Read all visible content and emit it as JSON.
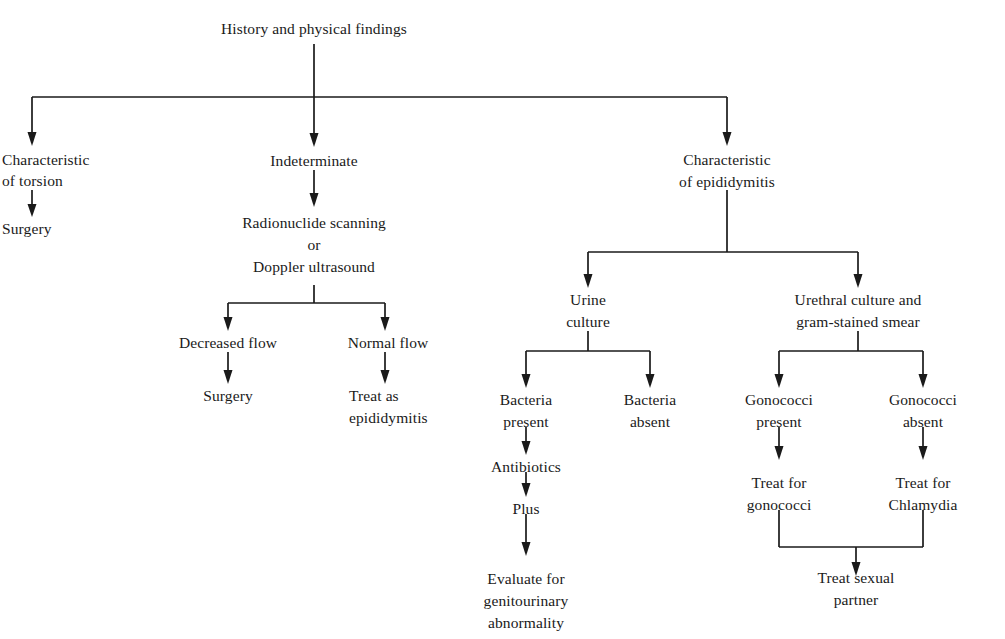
{
  "diagram": {
    "background_color": "#ffffff",
    "line_color": "#1a1a1a",
    "text_color": "#1a1a1a",
    "nodes": {
      "root": {
        "label": "History and physical findings",
        "x": 314,
        "y": 34
      },
      "torsion": {
        "line1": "Characteristic",
        "line2": "of torsion",
        "x": 22,
        "y": 159
      },
      "torsion_surgery": {
        "label": "Surgery",
        "x": 22,
        "y": 228
      },
      "indeterminate": {
        "label": "Indeterminate",
        "x": 314,
        "y": 160
      },
      "imaging": {
        "line1": "Radionuclide scanning",
        "line2": "or",
        "line3": "Doppler ultrasound",
        "x": 314,
        "y": 222
      },
      "decreased_flow": {
        "label": "Decreased flow",
        "x": 228,
        "y": 342
      },
      "normal_flow": {
        "label": "Normal flow",
        "x": 388,
        "y": 342
      },
      "flow_surgery": {
        "label": "Surgery",
        "x": 228,
        "y": 395
      },
      "treat_as_epi": {
        "line1": "Treat as",
        "line2": "epididymitis",
        "x": 349,
        "y": 395
      },
      "epididymitis": {
        "line1": "Characteristic",
        "line2": "of epididymitis",
        "x": 727,
        "y": 159
      },
      "urine_culture": {
        "line1": "Urine",
        "line2": "culture",
        "x": 588,
        "y": 299
      },
      "urethral_culture": {
        "line1": "Urethral culture and",
        "line2": "gram-stained smear",
        "x": 858,
        "y": 299
      },
      "bacteria_present": {
        "line1": "Bacteria",
        "line2": "present",
        "x": 526,
        "y": 399
      },
      "bacteria_absent": {
        "line1": "Bacteria",
        "line2": "absent",
        "x": 650,
        "y": 399
      },
      "antibiotics": {
        "label": "Antibiotics",
        "x": 526,
        "y": 466
      },
      "plus": {
        "label": "Plus",
        "x": 526,
        "y": 508
      },
      "evaluate_gu": {
        "line1": "Evaluate for",
        "line2": "genitourinary",
        "line3": "abnormality",
        "x": 526,
        "y": 578
      },
      "gonococci_present": {
        "line1": "Gonococci",
        "line2": "present",
        "x": 779,
        "y": 399
      },
      "gonococci_absent": {
        "line1": "Gonococci",
        "line2": "absent",
        "x": 923,
        "y": 399
      },
      "treat_gonococci": {
        "line1": "Treat for",
        "line2": "gonococci",
        "x": 779,
        "y": 482
      },
      "treat_chlamydia": {
        "line1": "Treat for",
        "line2": "Chlamydia",
        "x": 923,
        "y": 482
      },
      "treat_partner": {
        "line1": "Treat sexual",
        "line2": "partner",
        "x": 856,
        "y": 577
      }
    },
    "edges": [
      {
        "name": "root-to-split",
        "from": "root",
        "to": "top-split-bar"
      },
      {
        "name": "split-to-torsion",
        "from": "top-split-bar",
        "to": "torsion"
      },
      {
        "name": "split-to-indeterminate",
        "from": "top-split-bar",
        "to": "indeterminate"
      },
      {
        "name": "split-to-epididymitis",
        "from": "top-split-bar",
        "to": "epididymitis"
      },
      {
        "name": "torsion-to-surgery",
        "from": "torsion",
        "to": "torsion_surgery"
      },
      {
        "name": "indeterminate-to-imaging",
        "from": "indeterminate",
        "to": "imaging"
      },
      {
        "name": "imaging-to-flow-split",
        "from": "imaging",
        "to": "flow-split-bar"
      },
      {
        "name": "flow-split-to-decreased",
        "from": "flow-split-bar",
        "to": "decreased_flow"
      },
      {
        "name": "flow-split-to-normal",
        "from": "flow-split-bar",
        "to": "normal_flow"
      },
      {
        "name": "decreased-to-surgery",
        "from": "decreased_flow",
        "to": "flow_surgery"
      },
      {
        "name": "normal-to-treat-epi",
        "from": "normal_flow",
        "to": "treat_as_epi"
      },
      {
        "name": "epididymitis-to-culture-split",
        "from": "epididymitis",
        "to": "culture-split-bar"
      },
      {
        "name": "culture-split-to-urine",
        "from": "culture-split-bar",
        "to": "urine_culture"
      },
      {
        "name": "culture-split-to-urethral",
        "from": "culture-split-bar",
        "to": "urethral_culture"
      },
      {
        "name": "urine-to-bacteria-split",
        "from": "urine_culture",
        "to": "bacteria-split-bar"
      },
      {
        "name": "bacteria-split-to-present",
        "from": "bacteria-split-bar",
        "to": "bacteria_present"
      },
      {
        "name": "bacteria-split-to-absent",
        "from": "bacteria-split-bar",
        "to": "bacteria_absent"
      },
      {
        "name": "present-to-antibiotics",
        "from": "bacteria_present",
        "to": "antibiotics"
      },
      {
        "name": "antibiotics-to-plus",
        "from": "antibiotics",
        "to": "plus"
      },
      {
        "name": "plus-to-evaluate",
        "from": "plus",
        "to": "evaluate_gu"
      },
      {
        "name": "urethral-to-gonococci-split",
        "from": "urethral_culture",
        "to": "gonococci-split-bar"
      },
      {
        "name": "gonococci-split-to-present",
        "from": "gonococci-split-bar",
        "to": "gonococci_present"
      },
      {
        "name": "gonococci-split-to-absent",
        "from": "gonococci-split-bar",
        "to": "gonococci_absent"
      },
      {
        "name": "gono-present-to-treat",
        "from": "gonococci_present",
        "to": "treat_gonococci"
      },
      {
        "name": "gono-absent-to-treat",
        "from": "gonococci_absent",
        "to": "treat_chlamydia"
      },
      {
        "name": "treats-merge-to-partner",
        "from": "merge-bar",
        "to": "treat_partner"
      }
    ]
  }
}
